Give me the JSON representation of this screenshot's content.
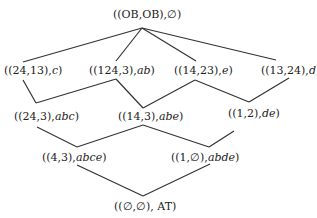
{
  "diagram": {
    "type": "lattice",
    "line_color": "#333333",
    "nodes": [
      {
        "id": "top",
        "pair": "((OB,OB),",
        "set": "∅",
        "close": ")",
        "x": 113,
        "y": 8
      },
      {
        "id": "n1",
        "pair": "((24,13),",
        "set": "c",
        "close": ")",
        "x": 4,
        "y": 64
      },
      {
        "id": "n2",
        "pair": "((124,3),",
        "set": "ab",
        "close": ")",
        "x": 89,
        "y": 64
      },
      {
        "id": "n3",
        "pair": "((14,23),",
        "set": "e",
        "close": ")",
        "x": 174,
        "y": 64
      },
      {
        "id": "n4",
        "pair": "((13,24),",
        "set": "d",
        "close": ")",
        "x": 261,
        "y": 64
      },
      {
        "id": "n5",
        "pair": "((24,3),",
        "set": "abc",
        "close": ")",
        "x": 14,
        "y": 110
      },
      {
        "id": "n6",
        "pair": "((14,3),",
        "set": "abe",
        "close": ")",
        "x": 118,
        "y": 110
      },
      {
        "id": "n7",
        "pair": "((1,2),",
        "set": "de",
        "close": ")",
        "x": 228,
        "y": 107
      },
      {
        "id": "n8",
        "pair": "((4,3),",
        "set": "abce",
        "close": ")",
        "x": 42,
        "y": 151
      },
      {
        "id": "n9",
        "pair": "((1,∅),",
        "set": "abde",
        "close": ")",
        "x": 171,
        "y": 151
      },
      {
        "id": "bottom",
        "pair": "((∅,∅), AT)",
        "set": "",
        "close": "",
        "x": 114,
        "y": 200
      }
    ],
    "edges": [
      [
        142,
        28,
        23,
        62
      ],
      [
        142,
        28,
        116,
        61
      ],
      [
        142,
        28,
        196,
        61
      ],
      [
        142,
        28,
        276,
        60
      ],
      [
        23,
        80,
        36,
        103
      ],
      [
        36,
        103,
        116,
        79
      ],
      [
        116,
        79,
        143,
        108
      ],
      [
        143,
        108,
        195,
        80
      ],
      [
        195,
        80,
        249,
        102
      ],
      [
        249,
        102,
        289,
        78
      ],
      [
        37,
        127,
        77,
        147
      ],
      [
        77,
        147,
        143,
        125
      ],
      [
        143,
        125,
        209,
        147
      ],
      [
        209,
        147,
        234,
        131
      ],
      [
        77,
        165,
        143,
        196
      ],
      [
        143,
        196,
        210,
        164
      ]
    ]
  }
}
